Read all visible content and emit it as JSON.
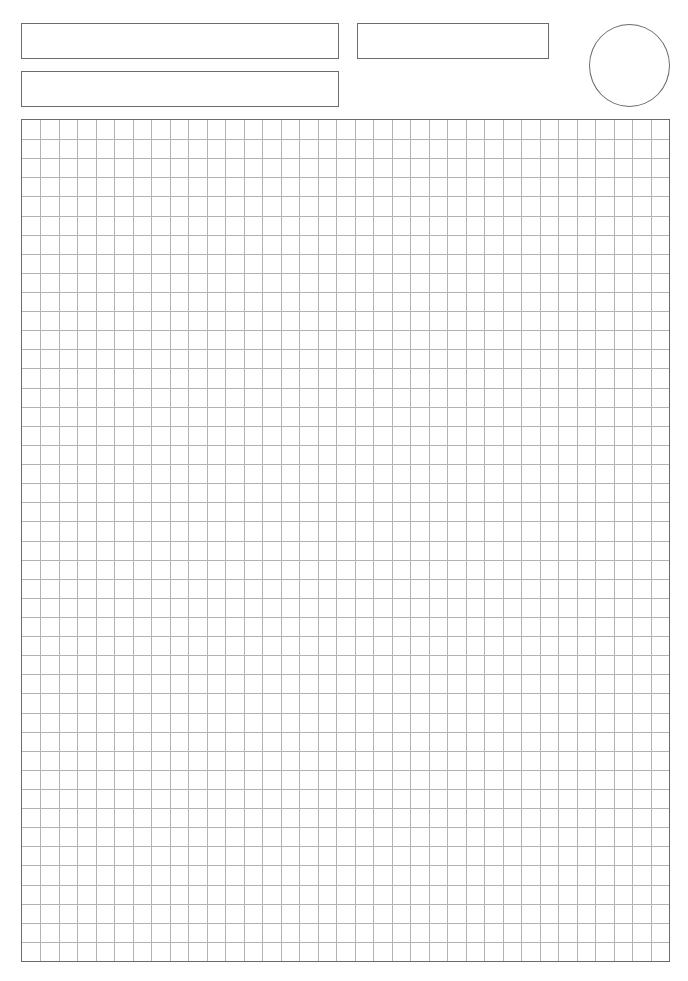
{
  "page": {
    "type": "graph-paper-worksheet",
    "background": "#ffffff"
  },
  "header": {
    "fields": [
      {
        "id": "field-1",
        "value": ""
      },
      {
        "id": "field-2",
        "value": ""
      },
      {
        "id": "field-3",
        "value": ""
      }
    ],
    "circle_field": {
      "value": ""
    }
  },
  "grid": {
    "columns": 35,
    "rows": 44,
    "line_color": "#b3b3b3",
    "border_color": "#6b6b6b"
  }
}
